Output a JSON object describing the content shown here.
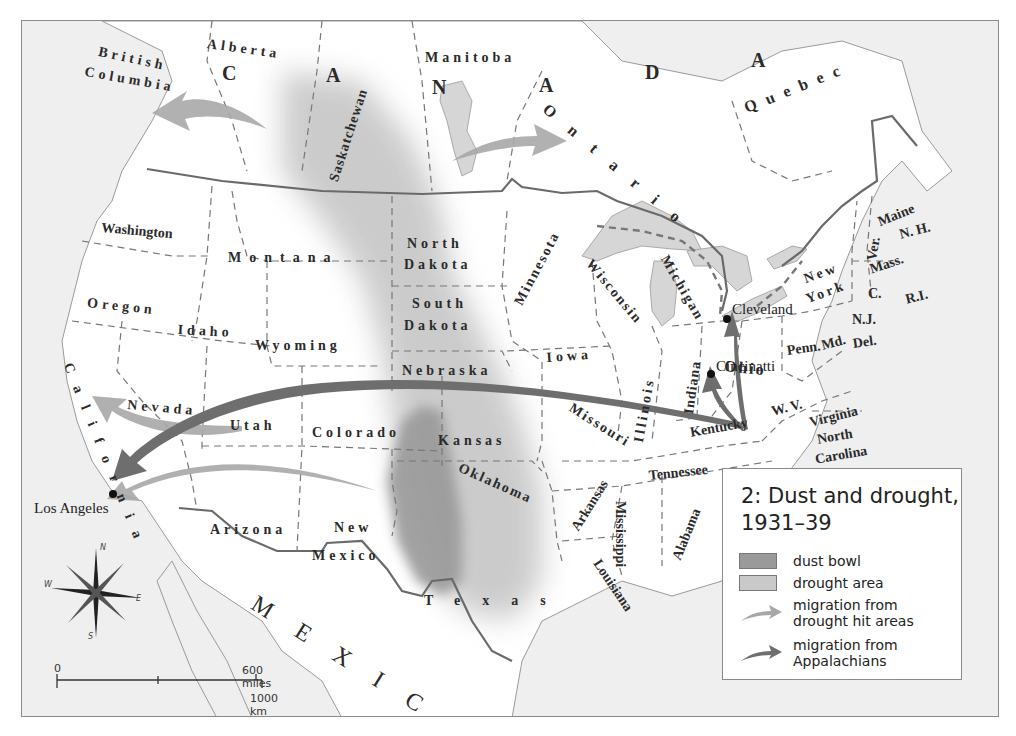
{
  "map": {
    "title": "2: Dust and drought, 1931–39",
    "countries": {
      "canada_letters": [
        "C",
        "A",
        "N",
        "A",
        "D",
        "A"
      ],
      "mexico": "MEXICO"
    },
    "provinces": [
      "British",
      "Columbia",
      "Alberta",
      "Saskatchewan",
      "Manitoba",
      "Ontario",
      "Quebec"
    ],
    "states": {
      "washington": "Washington",
      "oregon": "Oregon",
      "california": "California",
      "nevada": "Nevada",
      "idaho": "Idaho",
      "montana": "Montana",
      "wyoming": "Wyoming",
      "utah": "Utah",
      "arizona": "Arizona",
      "colorado": "Colorado",
      "new_mexico_1": "New",
      "new_mexico_2": "Mexico",
      "north_dakota_1": "North",
      "north_dakota_2": "Dakota",
      "south_dakota_1": "South",
      "south_dakota_2": "Dakota",
      "nebraska": "Nebraska",
      "kansas": "Kansas",
      "oklahoma": "Oklahoma",
      "texas": "Texas",
      "minnesota": "Minnesota",
      "iowa": "Iowa",
      "missouri": "Missouri",
      "arkansas": "Arkansas",
      "louisiana": "Louisiana",
      "wisconsin": "Wisconsin",
      "illinois": "Illinois",
      "michigan": "Michigan",
      "indiana": "Indiana",
      "ohio": "Ohio",
      "kentucky": "Kentucky",
      "tennessee": "Tennessee",
      "mississippi": "Mississippi",
      "alabama": "Alabama",
      "wv": "W. V.",
      "virginia": "Virginia",
      "north_carolina_1": "North",
      "north_carolina_2": "Carolina",
      "penn": "Penn.",
      "new_york_1": "New",
      "new_york_2": "York",
      "ver": "Ver.",
      "maine": "Maine",
      "nh": "N. H.",
      "mass": "Mass.",
      "conn": "C.",
      "ri": "R.I.",
      "nj": "N.J.",
      "md": "Md.",
      "del": "Del."
    },
    "cities": [
      {
        "name": "Los Angeles"
      },
      {
        "name": "Cleveland"
      },
      {
        "name": "Cincinatti"
      }
    ],
    "compass": {
      "n": "N",
      "s": "S",
      "e": "E",
      "w": "W"
    },
    "scale": {
      "zero": "0",
      "miles": "600 miles",
      "km": "1000 km"
    }
  },
  "legend": {
    "title_line1": "2: Dust and drought,",
    "title_line2": "1931–39",
    "items": [
      {
        "label": "dust bowl",
        "color": "#9a9a9a"
      },
      {
        "label": "drought area",
        "color": "#c9c9c9"
      },
      {
        "label_line1": "migration from",
        "label_line2": "drought hit areas",
        "color": "#a8a8a8"
      },
      {
        "label_line1": "migration from",
        "label_line2": "Appalachians",
        "color": "#6e6e6e"
      }
    ]
  },
  "colors": {
    "ocean": "#efefef",
    "land": "#ffffff",
    "lakes": "#d6d6d6",
    "dust_bowl": "#9a9a9a",
    "drought": "#c9c9c9",
    "arrow_drought": "#a8a8a8",
    "arrow_appalachian": "#6e6e6e",
    "border": "#6a6a6a"
  }
}
